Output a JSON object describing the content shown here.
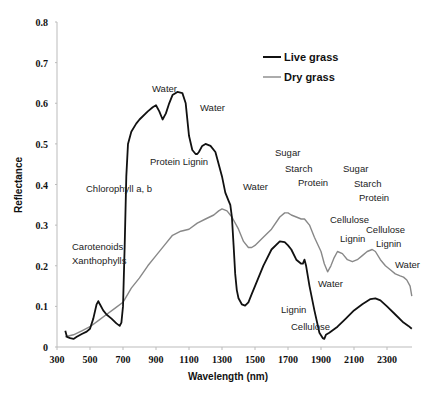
{
  "chart_data": {
    "type": "line",
    "title": "",
    "xlabel": "Wavelength (nm)",
    "ylabel": "Reflectance",
    "xlim": [
      300,
      2460
    ],
    "ylim": [
      0,
      0.8
    ],
    "xticks": [
      300,
      500,
      700,
      900,
      1100,
      1300,
      1500,
      1700,
      1900,
      2100,
      2300
    ],
    "yticks": [
      0,
      0.1,
      0.2,
      0.3,
      0.4,
      0.5,
      0.6,
      0.7,
      0.8
    ],
    "ytick_labels": [
      "0",
      "0.1",
      "0.2",
      "0.3",
      "0.4",
      "0.5",
      "0.6",
      "0.7",
      "0.8"
    ],
    "grid": false,
    "legend_position": "upper right",
    "series": [
      {
        "name": "Live grass",
        "color": "#111111",
        "x": [
          350,
          360,
          380,
          400,
          420,
          450,
          480,
          500,
          520,
          540,
          550,
          560,
          580,
          600,
          630,
          660,
          680,
          690,
          700,
          710,
          720,
          730,
          750,
          780,
          800,
          850,
          880,
          900,
          920,
          940,
          960,
          980,
          1000,
          1030,
          1060,
          1080,
          1100,
          1120,
          1140,
          1150,
          1160,
          1180,
          1200,
          1230,
          1260,
          1280,
          1300,
          1320,
          1340,
          1350,
          1360,
          1370,
          1380,
          1390,
          1400,
          1420,
          1440,
          1460,
          1480,
          1500,
          1550,
          1600,
          1650,
          1680,
          1700,
          1720,
          1750,
          1780,
          1790,
          1800,
          1810,
          1830,
          1860,
          1890,
          1910,
          1920,
          1930,
          1950,
          2000,
          2050,
          2100,
          2150,
          2200,
          2230,
          2260,
          2300,
          2350,
          2400,
          2430,
          2450
        ],
        "values": [
          0.04,
          0.025,
          0.022,
          0.02,
          0.025,
          0.032,
          0.038,
          0.045,
          0.07,
          0.105,
          0.113,
          0.105,
          0.09,
          0.08,
          0.07,
          0.058,
          0.052,
          0.06,
          0.1,
          0.25,
          0.42,
          0.5,
          0.53,
          0.55,
          0.56,
          0.58,
          0.59,
          0.595,
          0.58,
          0.56,
          0.575,
          0.6,
          0.62,
          0.628,
          0.625,
          0.6,
          0.52,
          0.485,
          0.475,
          0.475,
          0.48,
          0.495,
          0.5,
          0.495,
          0.48,
          0.45,
          0.42,
          0.38,
          0.36,
          0.35,
          0.32,
          0.25,
          0.18,
          0.14,
          0.12,
          0.105,
          0.102,
          0.11,
          0.13,
          0.15,
          0.2,
          0.24,
          0.26,
          0.258,
          0.25,
          0.24,
          0.215,
          0.205,
          0.205,
          0.215,
          0.2,
          0.15,
          0.09,
          0.035,
          0.022,
          0.02,
          0.03,
          0.035,
          0.05,
          0.07,
          0.09,
          0.105,
          0.118,
          0.12,
          0.115,
          0.1,
          0.08,
          0.06,
          0.052,
          0.045
        ]
      },
      {
        "name": "Dry grass",
        "color": "#888888",
        "x": [
          350,
          400,
          450,
          500,
          550,
          600,
          650,
          700,
          750,
          800,
          850,
          900,
          950,
          1000,
          1050,
          1100,
          1150,
          1200,
          1250,
          1280,
          1300,
          1330,
          1360,
          1400,
          1430,
          1460,
          1480,
          1500,
          1550,
          1600,
          1650,
          1680,
          1700,
          1720,
          1750,
          1780,
          1800,
          1830,
          1860,
          1900,
          1920,
          1940,
          1960,
          1980,
          2000,
          2030,
          2060,
          2090,
          2120,
          2150,
          2180,
          2210,
          2230,
          2260,
          2290,
          2320,
          2350,
          2380,
          2400,
          2420,
          2440,
          2450
        ],
        "values": [
          0.025,
          0.03,
          0.04,
          0.05,
          0.065,
          0.08,
          0.095,
          0.11,
          0.145,
          0.17,
          0.2,
          0.225,
          0.25,
          0.275,
          0.285,
          0.29,
          0.305,
          0.315,
          0.325,
          0.335,
          0.34,
          0.335,
          0.32,
          0.29,
          0.26,
          0.245,
          0.245,
          0.25,
          0.27,
          0.29,
          0.32,
          0.33,
          0.33,
          0.325,
          0.32,
          0.315,
          0.315,
          0.3,
          0.27,
          0.235,
          0.205,
          0.185,
          0.2,
          0.22,
          0.235,
          0.23,
          0.215,
          0.21,
          0.215,
          0.225,
          0.235,
          0.24,
          0.235,
          0.215,
          0.2,
          0.19,
          0.18,
          0.175,
          0.172,
          0.165,
          0.15,
          0.125
        ]
      }
    ],
    "legend": [
      {
        "label": "Live grass",
        "color": "#111111"
      },
      {
        "label": "Dry grass",
        "color": "#888888"
      }
    ],
    "annotations": [
      {
        "text": "Water",
        "x": 152,
        "y": 92
      },
      {
        "text": "Water",
        "x": 200,
        "y": 111
      },
      {
        "text": "Protein Lignin",
        "x": 150,
        "y": 165
      },
      {
        "text": "Chlorophyll a, b",
        "x": 86,
        "y": 192
      },
      {
        "text": "Water",
        "x": 243,
        "y": 190
      },
      {
        "text": "Sugar",
        "x": 275,
        "y": 156
      },
      {
        "text": "Starch",
        "x": 285,
        "y": 172
      },
      {
        "text": "Protein",
        "x": 298,
        "y": 186
      },
      {
        "text": "Sugar",
        "x": 343,
        "y": 172
      },
      {
        "text": "Starch",
        "x": 354,
        "y": 187
      },
      {
        "text": "Protein",
        "x": 359,
        "y": 201
      },
      {
        "text": "Carotenoids",
        "x": 72,
        "y": 250
      },
      {
        "text": "Xanthophylls",
        "x": 72,
        "y": 264
      },
      {
        "text": "Cellulose",
        "x": 330,
        "y": 223
      },
      {
        "text": "Cellulose",
        "x": 366,
        "y": 233
      },
      {
        "text": "Lignin",
        "x": 340,
        "y": 242
      },
      {
        "text": "Lignin",
        "x": 376,
        "y": 247
      },
      {
        "text": "Water",
        "x": 395,
        "y": 268
      },
      {
        "text": "Water",
        "x": 318,
        "y": 287
      },
      {
        "text": "Lignin",
        "x": 281,
        "y": 313
      },
      {
        "text": "Cellulose",
        "x": 291,
        "y": 330
      }
    ]
  }
}
